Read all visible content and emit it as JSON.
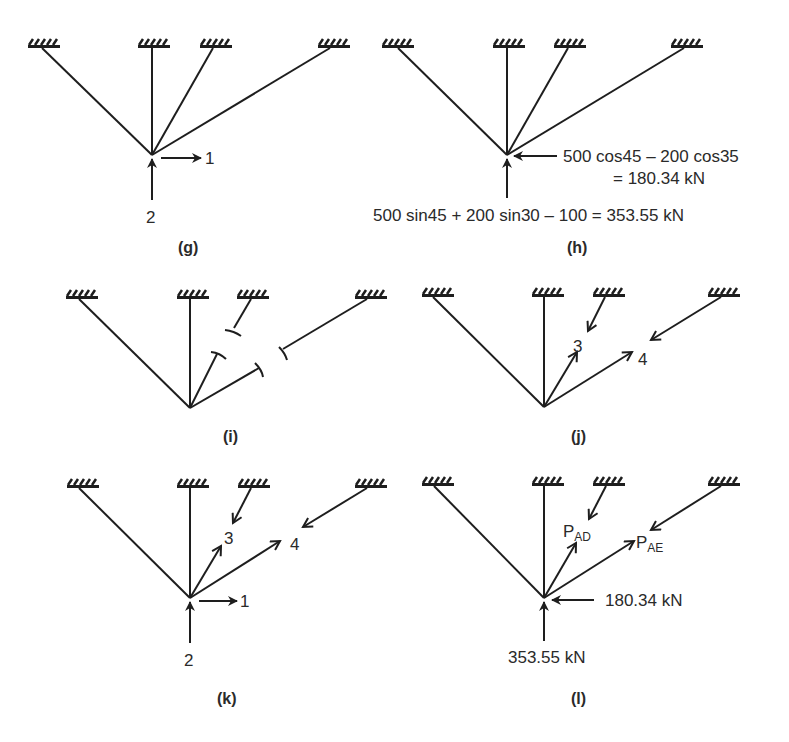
{
  "figure": {
    "colors": {
      "ink": "#1e1e1e",
      "background": "#ffffff"
    }
  },
  "panels": {
    "g": {
      "caption": "(g)",
      "labels": {
        "horizontal_load": "1",
        "vertical_load": "2"
      }
    },
    "h": {
      "caption": "(h)",
      "labels": {
        "horizontal_line1": "500 cos45 – 200 cos35",
        "horizontal_line2": "= 180.34 kN",
        "vertical": "500 sin45 + 200 sin30 – 100 = 353.55 kN"
      }
    },
    "i": {
      "caption": "(i)",
      "note": "members 3 and 4 cut"
    },
    "j": {
      "caption": "(j)",
      "labels": {
        "member3": "3",
        "member4": "4"
      }
    },
    "k": {
      "caption": "(k)",
      "labels": {
        "member3": "3",
        "member4": "4",
        "horizontal_load": "1",
        "vertical_load": "2"
      }
    },
    "l": {
      "caption": "(l)",
      "labels": {
        "member3_main": "P",
        "member3_sub": "AD",
        "member4_main": "P",
        "member4_sub": "AE",
        "horizontal": "180.34 kN",
        "vertical": "353.55 kN"
      }
    }
  }
}
